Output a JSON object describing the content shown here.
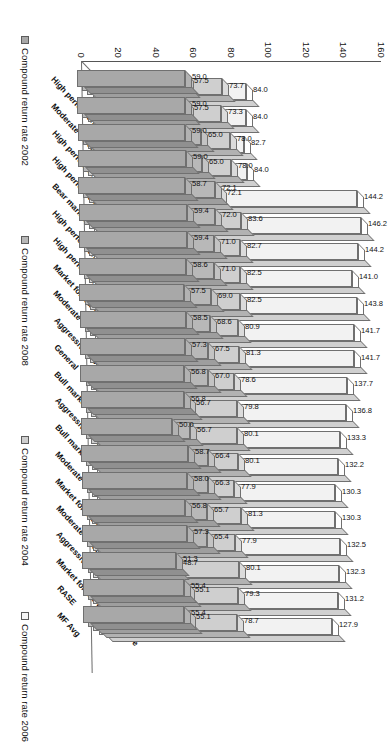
{
  "chart_data": {
    "type": "bar",
    "title": "",
    "subtitle": "",
    "xlabel": "",
    "ylabel": "",
    "ylim": [
      0,
      160
    ],
    "ytick_labels": [
      "0",
      "20",
      "40",
      "60",
      "80",
      "100",
      "120",
      "140",
      "160"
    ],
    "ytick_values": [
      0,
      20,
      40,
      60,
      80,
      100,
      120,
      140,
      160
    ],
    "grid": false,
    "legend_position": "bottom",
    "orientation": "3d-column-rotated-90ccw",
    "categories": [
      "High performance – Bull market",
      "Moderate – Bear market",
      "High performance",
      "High performance – Aggressive",
      "Bear market",
      "High performance – Bear market",
      "High performance – Market forecast",
      "Market forecast – Moderate",
      "Moderate",
      "Aggressive – Bear market",
      "General",
      "Bull market",
      "Aggressive – Bull market",
      "Bull market",
      "Moderate",
      "Market forecast",
      "Moderate – Bull market",
      "Aggressive",
      "Market forecast – Aggressive",
      "RASE",
      "MF Avg"
    ],
    "series": [
      {
        "name": "Compound return rate 2002",
        "color": "#a8a8a8",
        "values": [
          59.0,
          59.0,
          59.0,
          59.0,
          58.7,
          59.4,
          59.4,
          58.6,
          57.5,
          58.5,
          57.3,
          56.8,
          56.8,
          50.0,
          58.7,
          58.0,
          56.8,
          57.3,
          51.3,
          55.4,
          55.4
        ]
      },
      {
        "name": "Compound return rate 2008",
        "color": "#b8b8b8",
        "values": [
          57.5,
          57.5,
          65.0,
          65.0,
          72.1,
          72.0,
          71.0,
          71.0,
          69.0,
          68.6,
          67.5,
          67.0,
          56.7,
          56.7,
          66.4,
          66.3,
          65.7,
          65.4,
          48.7,
          55.1,
          55.1
        ]
      },
      {
        "name": "Compound return rate 2004",
        "color": "#cfcfcf",
        "values": [
          73.7,
          73.3,
          78.0,
          78.0,
          72.1,
          83.6,
          82.7,
          82.5,
          82.5,
          80.9,
          81.3,
          78.6,
          79.8,
          80.1,
          80.1,
          77.9,
          81.3,
          77.9,
          80.1,
          79.3,
          78.7
        ]
      },
      {
        "name": "Compound return rate 2006",
        "color": "#f2f2f2",
        "values": [
          84.0,
          84.0,
          82.7,
          84.0,
          144.2,
          146.2,
          144.2,
          141.0,
          143.8,
          141.7,
          141.7,
          137.7,
          136.8,
          133.3,
          132.2,
          130.3,
          130.3,
          132.5,
          132.3,
          131.2,
          127.9
        ]
      }
    ],
    "bar_labels_top": [
      "114.9",
      "122.5",
      "129.1",
      "127.9",
      "131.2",
      "132.3",
      "132.5",
      "130.3",
      "130.3",
      "132.2",
      "133.3",
      "136.8",
      "137.7",
      "141.7",
      "141.7",
      "143.8",
      "141.0",
      "144.2",
      "146.2",
      "144.2"
    ]
  },
  "axis": {
    "ticks": [
      "160",
      "140",
      "120",
      "100",
      "80",
      "60",
      "40",
      "20",
      "0"
    ]
  },
  "legend": {
    "items": [
      {
        "label": "Compound return rate 2002",
        "color": "#a8a8a8"
      },
      {
        "label": "Compound return rate 2008",
        "color": "#b8b8b8"
      },
      {
        "label": "Compound return rate 2004",
        "color": "#cfcfcf"
      },
      {
        "label": "Compound return rate 2006",
        "color": "#f7f7f7"
      }
    ]
  },
  "categories_display": [
    "High performance – Bull market",
    "Moderate – Bear market",
    "High performance",
    "High performance – Aggressive",
    "Bear market",
    "High performance – Bear market",
    "High performance – Market forecast",
    "Market forecast – Moderate",
    "Moderate",
    "Aggressive – Bear market",
    "General",
    "Bull market",
    "Aggressive – Bull market",
    "Bull market",
    "Moderate",
    "Market forecast",
    "Moderate – Bull market",
    "Aggressive",
    "Market forecast – Aggressive",
    "RASE",
    "MF Avg"
  ]
}
